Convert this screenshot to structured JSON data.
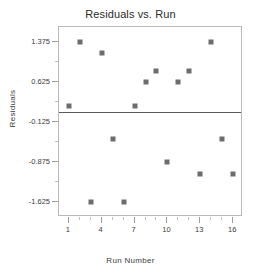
{
  "chart_data": {
    "type": "scatter",
    "title": "Residuals vs. Run",
    "xlabel": "Run Number",
    "ylabel": "Residuals",
    "x": [
      1,
      2,
      3,
      4,
      5,
      6,
      7,
      8,
      9,
      10,
      11,
      12,
      13,
      14,
      15,
      16
    ],
    "values": [
      0.17,
      1.375,
      -1.625,
      1.17,
      -0.44,
      -1.625,
      0.17,
      0.625,
      0.83,
      -0.875,
      0.625,
      0.83,
      -1.1,
      1.375,
      -0.44,
      -1.1
    ],
    "series": [
      {
        "name": "Residuals",
        "values": [
          0.17,
          1.375,
          -1.625,
          1.17,
          -0.44,
          -1.625,
          0.17,
          0.625,
          0.83,
          -0.875,
          0.625,
          0.83,
          -1.1,
          1.375,
          -0.44,
          -1.1
        ]
      }
    ],
    "xlim": [
      0.1,
      16.9
    ],
    "ylim": [
      -1.9,
      1.65
    ],
    "xticks": [
      1,
      4,
      7,
      10,
      13,
      16
    ],
    "xtick_labels": [
      "1",
      "4",
      "7",
      "10",
      "13",
      "16"
    ],
    "xticks_minor": [
      2,
      3,
      5,
      6,
      8,
      9,
      11,
      12,
      14,
      15
    ],
    "yticks": [
      1.375,
      0.625,
      -0.125,
      -0.875,
      -1.625
    ],
    "ytick_labels": [
      "1.375",
      "0.625",
      "-0.125",
      "-0.875",
      "-1.625"
    ],
    "yticks_minor": [
      1.0,
      0.25,
      -0.5,
      -1.25
    ],
    "grid": false,
    "legend": null,
    "reference_line": {
      "orientation": "horizontal",
      "value": 0.06
    },
    "marker": {
      "shape": "square",
      "color": "#6d6d6d",
      "size": 5
    },
    "frame_color": "#b9b9b9",
    "text_color": "#3c3c3c",
    "title_color": "#2b2b2b"
  }
}
